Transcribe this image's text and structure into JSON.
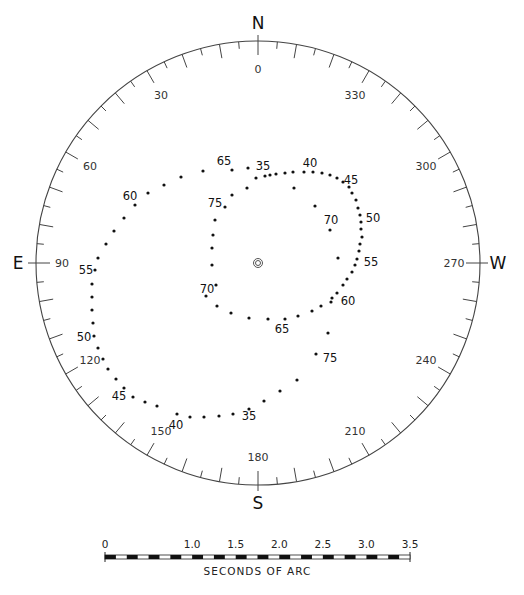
{
  "diagram": {
    "type": "polar-plot",
    "center": [
      258,
      263
    ],
    "radius": 222,
    "cardinals": [
      {
        "label": "N",
        "angle": 0
      },
      {
        "label": "E",
        "angle": 90
      },
      {
        "label": "S",
        "angle": 180
      },
      {
        "label": "W",
        "angle": 270
      }
    ],
    "degree_labels": [
      "0",
      "30",
      "60",
      "90",
      "120",
      "150",
      "180",
      "210",
      "240",
      "270",
      "300",
      "330"
    ],
    "degree_label_angles": [
      0,
      30,
      60,
      90,
      120,
      150,
      180,
      210,
      240,
      270,
      300,
      330
    ],
    "tick_step_deg": 5,
    "outer_loop_points": [
      [
        270,
        175
      ],
      [
        248,
        168
      ],
      [
        232,
        170
      ],
      [
        203,
        171
      ],
      [
        181,
        177
      ],
      [
        164,
        185
      ],
      [
        148,
        193
      ],
      [
        135,
        205
      ],
      [
        124,
        218
      ],
      [
        114,
        231
      ],
      [
        106,
        244
      ],
      [
        98,
        258
      ],
      [
        95,
        270
      ],
      [
        92,
        284
      ],
      [
        92,
        297
      ],
      [
        92,
        310
      ],
      [
        93,
        323
      ],
      [
        94,
        336
      ],
      [
        98,
        348
      ],
      [
        103,
        359
      ],
      [
        108,
        369
      ],
      [
        116,
        379
      ],
      [
        124,
        388
      ],
      [
        133,
        397
      ],
      [
        145,
        402
      ],
      [
        157,
        406
      ],
      [
        177,
        414
      ],
      [
        190,
        417
      ],
      [
        204,
        417
      ],
      [
        219,
        416
      ],
      [
        233,
        414
      ],
      [
        249,
        409
      ],
      [
        264,
        401
      ],
      [
        280,
        391
      ],
      [
        297,
        380
      ]
    ],
    "inner_loop_points": [
      [
        276,
        174
      ],
      [
        285,
        173
      ],
      [
        293,
        172
      ],
      [
        304,
        172
      ],
      [
        313,
        172
      ],
      [
        322,
        173
      ],
      [
        330,
        175
      ],
      [
        337,
        178
      ],
      [
        343,
        182
      ],
      [
        349,
        187
      ],
      [
        352,
        193
      ],
      [
        356,
        200
      ],
      [
        358,
        208
      ],
      [
        360,
        215
      ],
      [
        361,
        222
      ],
      [
        361,
        229
      ],
      [
        362,
        237
      ],
      [
        360,
        244
      ],
      [
        359,
        251
      ],
      [
        357,
        259
      ],
      [
        355,
        265
      ],
      [
        352,
        272
      ],
      [
        347,
        279
      ],
      [
        343,
        285
      ],
      [
        337,
        293
      ],
      [
        331,
        302
      ],
      [
        321,
        306
      ],
      [
        312,
        311
      ],
      [
        298,
        316
      ],
      [
        285,
        319
      ],
      [
        268,
        319
      ],
      [
        249,
        318
      ],
      [
        231,
        313
      ],
      [
        217,
        306
      ],
      [
        206,
        296
      ],
      [
        216,
        285
      ],
      [
        212,
        265
      ],
      [
        212,
        248
      ],
      [
        213,
        235
      ],
      [
        215,
        220
      ],
      [
        225,
        207
      ],
      [
        232,
        195
      ],
      [
        247,
        188
      ],
      [
        256,
        178
      ],
      [
        265,
        176
      ]
    ],
    "spiral_points": [
      [
        294,
        188
      ],
      [
        315,
        206
      ],
      [
        330,
        230
      ],
      [
        338,
        258
      ],
      [
        332,
        298
      ],
      [
        328,
        333
      ],
      [
        316,
        354
      ]
    ],
    "point_labels": [
      {
        "text": "65",
        "x": 224,
        "y": 165
      },
      {
        "text": "35",
        "x": 263,
        "y": 170
      },
      {
        "text": "40",
        "x": 310,
        "y": 167
      },
      {
        "text": "45",
        "x": 351,
        "y": 184
      },
      {
        "text": "50",
        "x": 373,
        "y": 222
      },
      {
        "text": "55",
        "x": 371,
        "y": 266
      },
      {
        "text": "60",
        "x": 348,
        "y": 305
      },
      {
        "text": "65",
        "x": 282,
        "y": 333
      },
      {
        "text": "70",
        "x": 207,
        "y": 293
      },
      {
        "text": "75",
        "x": 215,
        "y": 207
      },
      {
        "text": "70",
        "x": 331,
        "y": 224
      },
      {
        "text": "75",
        "x": 330,
        "y": 362
      },
      {
        "text": "60",
        "x": 130,
        "y": 200
      },
      {
        "text": "55",
        "x": 86,
        "y": 274
      },
      {
        "text": "50",
        "x": 84,
        "y": 341
      },
      {
        "text": "45",
        "x": 119,
        "y": 400
      },
      {
        "text": "40",
        "x": 176,
        "y": 429
      },
      {
        "text": "35",
        "x": 249,
        "y": 420
      }
    ],
    "center_symbol": "double-circle"
  },
  "scale_bar": {
    "tick_labels": [
      "0",
      "1.0",
      "1.5",
      "2.0",
      "2.5",
      "3.0",
      "3.5"
    ],
    "caption": "SECONDS OF ARC",
    "x_start": 105,
    "x_end": 410,
    "y": 557
  }
}
